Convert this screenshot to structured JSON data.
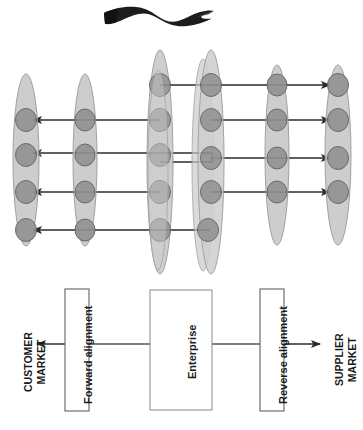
{
  "figure": {
    "orientation": "rotated-90-ccw",
    "canvas": {
      "width": 363,
      "height": 430
    },
    "colors": {
      "lens_fill": "#c9c9c9",
      "lens_stroke": "#8c8c8c",
      "node_fill": "#8f8f8f",
      "node_stroke": "#5e5e5e",
      "arrow": "#2b2b2b",
      "box_stroke": "#6e6e6e",
      "box_fill": "#ffffff",
      "swoosh": "#1c1c1c",
      "text": "#1a1a1a",
      "background": "#ffffff"
    }
  },
  "flow": {
    "customer_market_label": "CUSTOMER\nMARKET",
    "customer_market_line1": "CUSTOMER",
    "customer_market_line2": "MARKET",
    "supplier_market_line1": "SUPPLIER",
    "supplier_market_line2": "MARKET",
    "forward_alignment_label": "Forward alignment",
    "reverse_alignment_label": "Reverse alignment",
    "enterprise_label": "Enterprise",
    "arrow_to_customer": "arrow-left",
    "arrow_to_supplier": "arrow-right"
  },
  "network": {
    "lens_count": 6,
    "lenses": [
      {
        "id": "lens-1",
        "cx": 26,
        "cy": 160,
        "rx": 13,
        "ry": 86,
        "node_count": 4,
        "node_ys": [
          120,
          155,
          192,
          230
        ]
      },
      {
        "id": "lens-2",
        "cx": 85,
        "cy": 160,
        "rx": 12,
        "ry": 86,
        "node_count": 4,
        "node_ys": [
          120,
          155,
          192,
          230
        ]
      },
      {
        "id": "lens-3",
        "cx": 160,
        "cy": 162,
        "rx": 13,
        "ry": 112,
        "node_count": 5,
        "node_ys": [
          85,
          120,
          155,
          192,
          230
        ]
      },
      {
        "id": "lens-4",
        "cx": 210,
        "cy": 162,
        "rx": 13,
        "ry": 112,
        "node_count": 5,
        "node_ys": [
          85,
          120,
          155,
          192,
          230
        ]
      },
      {
        "id": "lens-5",
        "cx": 277,
        "cy": 160,
        "rx": 12,
        "ry": 90,
        "node_count": 4,
        "node_ys": [
          85,
          120,
          155,
          192
        ]
      },
      {
        "id": "lens-6",
        "cx": 337,
        "cy": 160,
        "rx": 13,
        "ry": 90,
        "node_count": 4,
        "node_ys": [
          85,
          120,
          155,
          192
        ]
      }
    ],
    "connections": [
      {
        "id": "row-1-right",
        "y": 85,
        "x1": 160,
        "x2": 337,
        "direction": "right"
      },
      {
        "id": "row-2-left",
        "y": 120,
        "x1": 160,
        "x2": 26,
        "direction": "left"
      },
      {
        "id": "row-2-right",
        "y": 120,
        "x1": 210,
        "x2": 337,
        "direction": "right"
      },
      {
        "id": "row-3-left",
        "y": 153,
        "x1": 160,
        "x2": 26,
        "direction": "left"
      },
      {
        "id": "row-3-mid",
        "y": 160,
        "x1": 160,
        "x2": 210,
        "direction": "none"
      },
      {
        "id": "row-3-right",
        "y": 155,
        "x1": 210,
        "x2": 337,
        "direction": "right"
      },
      {
        "id": "row-4-left",
        "y": 192,
        "x1": 160,
        "x2": 26,
        "direction": "left"
      },
      {
        "id": "row-4-right",
        "y": 192,
        "x1": 210,
        "x2": 337,
        "direction": "right"
      },
      {
        "id": "row-5-left",
        "y": 230,
        "x1": 210,
        "x2": 26,
        "direction": "left"
      }
    ]
  },
  "swoosh": {
    "name": "swoosh-graphic",
    "cx": 150,
    "cy": 14
  }
}
